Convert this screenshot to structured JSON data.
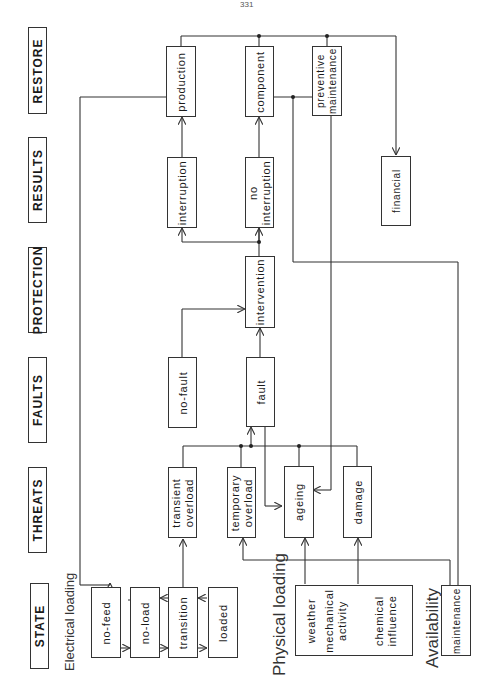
{
  "page_number": "331",
  "headers": {
    "restore": "RESTORE",
    "results": "RESULTS",
    "protection": "PROTECTION",
    "faults": "FAULTS",
    "threats": "THREATS",
    "state": "STATE"
  },
  "section_labels": {
    "electrical_loading": "Electrical loading",
    "physical_loading": "Physical loading",
    "availability": "Availability"
  },
  "restore": {
    "production": "production",
    "component": "component",
    "preventive_maintenance": "preventive\nmaintenance",
    "financial": "financial"
  },
  "results": {
    "interruption": "interruption",
    "no_interruption": "no\ninterruption"
  },
  "protection": {
    "intervention": "intervention"
  },
  "faults": {
    "no_fault": "no-fault",
    "fault": "fault"
  },
  "threats": {
    "transient_overload": "transient\noverload",
    "temporary_overload": "temporary\noverload",
    "ageing": "ageing",
    "damage": "damage"
  },
  "state": {
    "no_feed": "no-feed",
    "no_load": "no-load",
    "transition": "transition",
    "loaded": "loaded"
  },
  "physical": {
    "weather": "weather",
    "mechanical_activity": "mechanical\nactivity",
    "chemical_influence": "chemical\ninfluence"
  },
  "availability": {
    "maintenance": "maintenance"
  },
  "colors": {
    "line": "#333333",
    "background": "#ffffff"
  }
}
